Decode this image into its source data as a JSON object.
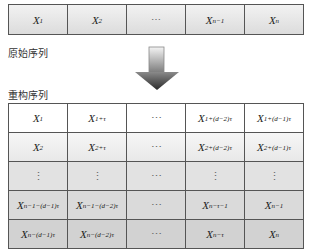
{
  "original": {
    "label": "原始序列",
    "cells": [
      {
        "base": "X",
        "sub": "1"
      },
      {
        "base": "X",
        "sub": "2"
      },
      {
        "base": "⋯",
        "sub": ""
      },
      {
        "base": "X",
        "sub": "n−1"
      },
      {
        "base": "X",
        "sub": "n"
      }
    ]
  },
  "arrow": {
    "icon": "down-arrow-icon"
  },
  "reconstructed": {
    "label": "重构序列",
    "rows": [
      [
        {
          "base": "X",
          "sub": "1"
        },
        {
          "base": "X",
          "sub": "1+τ"
        },
        {
          "base": "⋯",
          "sub": ""
        },
        {
          "base": "X",
          "sub": "1+(d−2)τ"
        },
        {
          "base": "X",
          "sub": "1+(d−1)τ"
        }
      ],
      [
        {
          "base": "X",
          "sub": "2"
        },
        {
          "base": "X",
          "sub": "2+τ"
        },
        {
          "base": "⋯",
          "sub": ""
        },
        {
          "base": "X",
          "sub": "2+(d−2)τ"
        },
        {
          "base": "X",
          "sub": "2+(d−1)τ"
        }
      ],
      [
        {
          "base": "⋮",
          "sub": ""
        },
        {
          "base": "⋮",
          "sub": ""
        },
        {
          "base": "⋯",
          "sub": ""
        },
        {
          "base": "⋮",
          "sub": ""
        },
        {
          "base": "⋮",
          "sub": ""
        }
      ],
      [
        {
          "base": "X",
          "sub": "n−1−(d−1)τ"
        },
        {
          "base": "X",
          "sub": "n−1−(d−2)τ"
        },
        {
          "base": "⋯",
          "sub": ""
        },
        {
          "base": "X",
          "sub": "n−τ−1"
        },
        {
          "base": "X",
          "sub": "n−1"
        }
      ],
      [
        {
          "base": "X",
          "sub": "n−(d−1)τ"
        },
        {
          "base": "X",
          "sub": "n−(d−2)τ"
        },
        {
          "base": "⋯",
          "sub": ""
        },
        {
          "base": "X",
          "sub": "n−τ"
        },
        {
          "base": "X",
          "sub": "n"
        }
      ]
    ]
  }
}
